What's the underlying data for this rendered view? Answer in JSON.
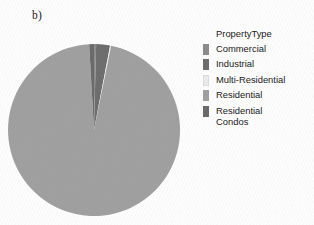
{
  "panel": {
    "label": "b)"
  },
  "legend": {
    "title": "PropertyType",
    "position": "right",
    "items": [
      {
        "label": "Commercial",
        "color": "#8c8c8c"
      },
      {
        "label": "Industrial",
        "color": "#6e6e6e"
      },
      {
        "label": "Multi-Residential",
        "color": "#ececec"
      },
      {
        "label": "Residential",
        "color": "#a0a0a0"
      },
      {
        "label": "Residential\nCondos",
        "color": "#6b6b6b"
      }
    ]
  },
  "chart_data": {
    "type": "pie",
    "title": "b)",
    "legend_title": "PropertyType",
    "legend_position": "right",
    "grid": false,
    "labels": [
      "Commercial",
      "Industrial",
      "Multi-Residential",
      "Residential",
      "Residential Condos"
    ],
    "values": [
      0.4,
      2.6,
      0.2,
      95.9,
      0.9
    ],
    "unit": "percent",
    "start_angle": -90,
    "direction": "clockwise",
    "colors": [
      "#8c8c8c",
      "#6e6e6e",
      "#ececec",
      "#a0a0a0",
      "#6b6b6b"
    ]
  },
  "geometry": {
    "center_x": 86,
    "center_y": 86,
    "radius": 86
  }
}
